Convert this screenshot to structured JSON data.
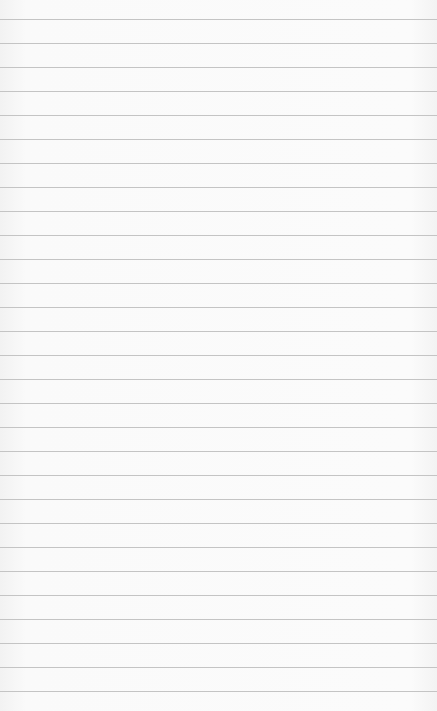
{
  "paper": {
    "type": "lined-notebook-paper",
    "background_color": "#f9f9f9",
    "rule_color": "#c4c4c4",
    "first_rule_y": 19,
    "rule_spacing": 24,
    "rule_count": 29
  }
}
